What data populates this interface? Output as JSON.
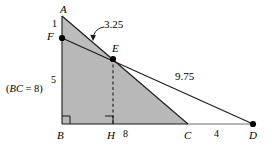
{
  "figure": {
    "width": 272,
    "height": 147,
    "background_color": "#ffffff",
    "fill_color": "#b8b8b8",
    "stroke_color": "#1a1a1a",
    "note": "(BC = 8)",
    "note_italic_part": "BC",
    "note_rest": " = 8)",
    "note_open": "("
  },
  "points": {
    "A": {
      "label": "A",
      "x": 62,
      "y": 16,
      "label_x": 60,
      "label_y": 4,
      "dot": false
    },
    "F": {
      "label": "F",
      "x": 62,
      "y": 38,
      "label_x": 47,
      "label_y": 32,
      "dot": true
    },
    "E": {
      "label": "E",
      "x": 113,
      "y": 59,
      "label_x": 112,
      "label_y": 44,
      "dot": true
    },
    "B": {
      "label": "B",
      "x": 62,
      "y": 124,
      "label_x": 57,
      "label_y": 130,
      "dot": false
    },
    "H": {
      "label": "H",
      "x": 113,
      "y": 124,
      "label_x": 108,
      "label_y": 130,
      "dot": false
    },
    "C": {
      "label": "C",
      "x": 188,
      "y": 124,
      "label_x": 185,
      "label_y": 130,
      "dot": false
    },
    "D": {
      "label": "D",
      "x": 253,
      "y": 124,
      "label_x": 250,
      "label_y": 130,
      "dot": true
    }
  },
  "measurements": {
    "AF": {
      "value": "1",
      "x": 52,
      "y": 20
    },
    "FB": {
      "value": "5",
      "x": 52,
      "y": 76
    },
    "FE_leader": {
      "value": "3.25",
      "x": 90,
      "y": 21
    },
    "ED": {
      "value": "9.75",
      "x": 178,
      "y": 73
    },
    "BC": {
      "value": "8",
      "x": 124,
      "y": 129
    },
    "CD": {
      "value": "4",
      "x": 216,
      "y": 129
    }
  },
  "segments": [
    {
      "name": "segment-AB",
      "from": "A",
      "to": "B"
    },
    {
      "name": "segment-AC",
      "from": "A",
      "to": "C"
    },
    {
      "name": "segment-BC",
      "from": "B",
      "to": "C"
    },
    {
      "name": "segment-CD",
      "from": "C",
      "to": "D"
    },
    {
      "name": "segment-FD",
      "from": "F",
      "to": "D"
    },
    {
      "name": "segment-EC",
      "from": "E",
      "to": "C"
    },
    {
      "name": "segment-EH-dashed",
      "from": "E",
      "to": "H",
      "dashed": true
    }
  ],
  "right_angles": [
    {
      "name": "right-angle-B",
      "at": "B"
    },
    {
      "name": "right-angle-H",
      "at": "H"
    }
  ],
  "shaded_region": {
    "name": "shaded-polygon-ABCE",
    "description": "triangle A-B-C shaded, bounded by A, F, E, C, B"
  }
}
